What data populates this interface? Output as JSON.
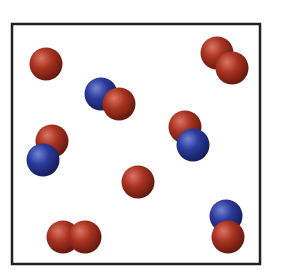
{
  "diagram": {
    "title": "Gas particles in a container",
    "container": {
      "x": 12,
      "y": 24,
      "width": 248,
      "height": 240,
      "stroke": "#222222",
      "stroke_width": 2.5
    },
    "colors": {
      "red": {
        "base": "#a83220",
        "highlight": "#dc7464",
        "shade": "#5e160c"
      },
      "blue": {
        "base": "#2a3a9a",
        "highlight": "#7484d2",
        "shade": "#121a56"
      }
    },
    "atom_radius": 16.5,
    "particles": [
      {
        "id": "atom-1",
        "type": "single red atom",
        "atoms": [
          {
            "color": "red",
            "cx": 46,
            "cy": 64
          }
        ]
      },
      {
        "id": "molecule-1",
        "type": "red-red diatomic",
        "atoms": [
          {
            "color": "red",
            "cx": 217,
            "cy": 53
          },
          {
            "color": "red",
            "cx": 232,
            "cy": 68
          }
        ]
      },
      {
        "id": "molecule-2",
        "type": "blue-red diatomic",
        "atoms": [
          {
            "color": "blue",
            "cx": 101,
            "cy": 94
          },
          {
            "color": "red",
            "cx": 119,
            "cy": 104
          }
        ]
      },
      {
        "id": "molecule-3",
        "type": "red-blue diatomic",
        "atoms": [
          {
            "color": "red",
            "cx": 185,
            "cy": 127
          },
          {
            "color": "blue",
            "cx": 193,
            "cy": 145
          }
        ]
      },
      {
        "id": "molecule-4",
        "type": "red-blue diatomic",
        "atoms": [
          {
            "color": "red",
            "cx": 52,
            "cy": 141
          },
          {
            "color": "blue",
            "cx": 43,
            "cy": 160
          }
        ]
      },
      {
        "id": "atom-2",
        "type": "single red atom",
        "atoms": [
          {
            "color": "red",
            "cx": 138,
            "cy": 182
          }
        ]
      },
      {
        "id": "molecule-5",
        "type": "red-red diatomic",
        "atoms": [
          {
            "color": "red",
            "cx": 63,
            "cy": 237
          },
          {
            "color": "red",
            "cx": 85,
            "cy": 237
          }
        ]
      },
      {
        "id": "molecule-6",
        "type": "blue-red diatomic",
        "atoms": [
          {
            "color": "blue",
            "cx": 226,
            "cy": 216
          },
          {
            "color": "red",
            "cx": 228,
            "cy": 237
          }
        ]
      }
    ],
    "summary": {
      "single_red_atoms": 2,
      "red_red_molecules": 2,
      "red_blue_molecules": 4,
      "total_particles": 8
    }
  }
}
